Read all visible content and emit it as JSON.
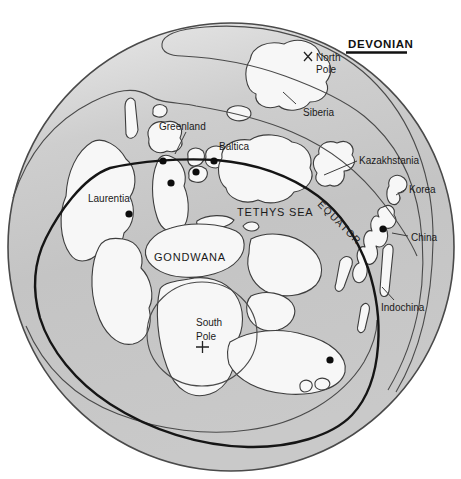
{
  "figure": {
    "title": "DEVONIAN",
    "labels": {
      "north_pole_line1": "North",
      "north_pole_line2": "Pole",
      "siberia": "Siberia",
      "greenland": "Greenland",
      "baltica": "Baltica",
      "kazakhstania": "Kazakhstania",
      "korea": "Korea",
      "china": "China",
      "indochina": "Indochina",
      "laurentia": "Laurentia",
      "tethys_sea": "TETHYS SEA",
      "equator": "EQUATOR",
      "gondwana": "GONDWANA",
      "south_pole_line1": "South",
      "south_pole_line2": "Pole"
    },
    "localities": [
      {
        "x": 163,
        "y": 161
      },
      {
        "x": 214,
        "y": 161
      },
      {
        "x": 196,
        "y": 172
      },
      {
        "x": 171,
        "y": 183
      },
      {
        "x": 129,
        "y": 214
      },
      {
        "x": 383,
        "y": 229
      },
      {
        "x": 330,
        "y": 360
      }
    ],
    "colors": {
      "ocean": "#c6c6c6",
      "ocean_light": "#e9e9e9",
      "land": "#f7f7f7",
      "outline": "#3d3d3d",
      "equator": "#151515"
    }
  }
}
